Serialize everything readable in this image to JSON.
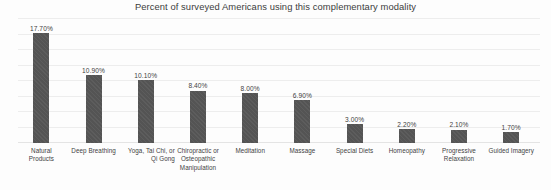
{
  "chart_data": {
    "type": "bar",
    "title": "Percent of surveyed Americans using this complementary modality",
    "xlabel": "",
    "ylabel": "",
    "ylim": [
      0,
      20
    ],
    "grid": true,
    "gridline_count": 9,
    "legend": "none",
    "orientation": "vertical",
    "value_suffix": "%",
    "categories": [
      "Natural Products",
      "Deep Breathing",
      "Yoga, Tai Chi, or Qi Gong",
      "Chiropractic or Osteopathic Manipulation",
      "Meditation",
      "Massage",
      "Special Diets",
      "Homeopathy",
      "Progressive Relaxation",
      "Guided Imagery"
    ],
    "values": [
      17.7,
      10.9,
      10.1,
      8.4,
      8.0,
      6.9,
      3.0,
      2.2,
      2.1,
      1.7
    ],
    "data_labels": [
      "17.70%",
      "10.90%",
      "10.10%",
      "8.40%",
      "8.00%",
      "6.90%",
      "3.00%",
      "2.20%",
      "2.10%",
      "1.70%"
    ],
    "bars": [
      {
        "label": "Natural Products",
        "value": 17.7,
        "data_label": "17.70%",
        "label_lines": [
          "Natural",
          "Products"
        ],
        "label_align": "center"
      },
      {
        "label": "Deep Breathing",
        "value": 10.9,
        "data_label": "10.90%",
        "label_lines": [
          "Deep Breathing"
        ],
        "label_align": "center"
      },
      {
        "label": "Yoga, Tai Chi, or Qi Gong",
        "value": 10.1,
        "data_label": "10.10%",
        "label_lines": [
          "Yoga, Tai Chi, or",
          "Qi Gong"
        ],
        "label_align": "right"
      },
      {
        "label": "Chiropractic or Osteopathic Manipulation",
        "value": 8.4,
        "data_label": "8.40%",
        "label_lines": [
          "Chiropractic or",
          "Osteopathic",
          "Manipulation"
        ],
        "label_align": "center"
      },
      {
        "label": "Meditation",
        "value": 8.0,
        "data_label": "8.00%",
        "label_lines": [
          "Meditation"
        ],
        "label_align": "center"
      },
      {
        "label": "Massage",
        "value": 6.9,
        "data_label": "6.90%",
        "label_lines": [
          "Massage"
        ],
        "label_align": "center"
      },
      {
        "label": "Special Diets",
        "value": 3.0,
        "data_label": "3.00%",
        "label_lines": [
          "Special Diets"
        ],
        "label_align": "center"
      },
      {
        "label": "Homeopathy",
        "value": 2.2,
        "data_label": "2.20%",
        "label_lines": [
          "Homeopathy"
        ],
        "label_align": "center"
      },
      {
        "label": "Progressive Relaxation",
        "value": 2.1,
        "data_label": "2.10%",
        "label_lines": [
          "Progressive",
          "Relaxation"
        ],
        "label_align": "center"
      },
      {
        "label": "Guided Imagery",
        "value": 1.7,
        "data_label": "1.70%",
        "label_lines": [
          "Guided Imagery"
        ],
        "label_align": "center"
      }
    ],
    "colors": {
      "bar": "#545454",
      "background": "#fdfdfd",
      "gridline": "#ededed",
      "title_text": "#3c3c3c",
      "label_text": "#3f3f3f"
    }
  }
}
